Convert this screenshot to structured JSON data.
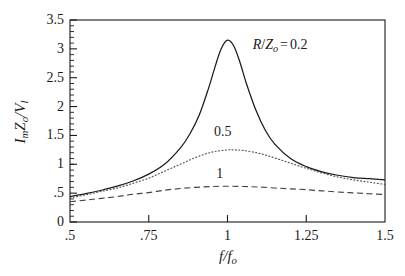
{
  "chart_data": {
    "type": "line",
    "title": "",
    "subtitle": "",
    "xlabel": "f/f_o",
    "ylabel": "I_m Z_o / V_l",
    "xlim": [
      0.5,
      1.5
    ],
    "ylim": [
      0,
      3.5
    ],
    "xticks": [
      0.5,
      0.75,
      1,
      1.25,
      1.5
    ],
    "xtick_labels": [
      ".5",
      ".75",
      "1",
      "1.25",
      "1.5"
    ],
    "yticks": [
      0,
      0.5,
      1,
      1.5,
      2,
      2.5,
      3,
      3.5
    ],
    "ytick_labels": [
      "0",
      ".5",
      "1",
      "1.5",
      "2",
      "2.5",
      "3",
      "3.5"
    ],
    "grid": false,
    "legend_position": "inline-annotations",
    "minor_ticks": true,
    "axis_color": "#1a1a1a",
    "background_color": "#ffffff",
    "series": [
      {
        "name": "R/Zo = 0.2",
        "label": "0.2",
        "style": "solid",
        "color": "#1a1a1a",
        "damping": 0.2,
        "peak_x": 1.0,
        "peak_y": 3.15,
        "x": [
          0.5,
          0.55,
          0.6,
          0.65,
          0.7,
          0.75,
          0.8,
          0.85,
          0.88,
          0.91,
          0.94,
          0.96,
          0.98,
          1.0,
          1.02,
          1.04,
          1.06,
          1.09,
          1.12,
          1.15,
          1.2,
          1.25,
          1.3,
          1.35,
          1.4,
          1.45,
          1.5
        ],
        "y": [
          0.44,
          0.49,
          0.55,
          0.62,
          0.71,
          0.83,
          1.0,
          1.28,
          1.52,
          1.85,
          2.32,
          2.68,
          3.0,
          3.15,
          3.05,
          2.76,
          2.4,
          1.94,
          1.59,
          1.35,
          1.1,
          0.96,
          0.87,
          0.81,
          0.77,
          0.75,
          0.73
        ]
      },
      {
        "name": "R/Zo = 0.5",
        "label": "0.5",
        "style": "dotted",
        "color": "#555555",
        "damping": 0.5,
        "peak_x": 1.02,
        "peak_y": 1.25,
        "x": [
          0.5,
          0.55,
          0.6,
          0.65,
          0.7,
          0.75,
          0.8,
          0.85,
          0.9,
          0.95,
          1.0,
          1.02,
          1.05,
          1.1,
          1.15,
          1.2,
          1.25,
          1.3,
          1.35,
          1.4,
          1.45,
          1.5
        ],
        "y": [
          0.42,
          0.47,
          0.53,
          0.59,
          0.67,
          0.76,
          0.88,
          1.0,
          1.12,
          1.21,
          1.25,
          1.25,
          1.24,
          1.19,
          1.11,
          1.02,
          0.93,
          0.85,
          0.78,
          0.73,
          0.69,
          0.65
        ]
      },
      {
        "name": "R/Zo = 1",
        "label": "1",
        "style": "dashed",
        "color": "#444444",
        "damping": 1.0,
        "peak_x": 0.99,
        "peak_y": 0.62,
        "x": [
          0.5,
          0.55,
          0.6,
          0.65,
          0.7,
          0.75,
          0.8,
          0.85,
          0.9,
          0.95,
          1.0,
          1.05,
          1.1,
          1.15,
          1.2,
          1.25,
          1.3,
          1.35,
          1.4,
          1.45,
          1.5
        ],
        "y": [
          0.35,
          0.38,
          0.41,
          0.44,
          0.48,
          0.51,
          0.55,
          0.58,
          0.6,
          0.615,
          0.62,
          0.615,
          0.605,
          0.59,
          0.575,
          0.56,
          0.54,
          0.52,
          0.505,
          0.49,
          0.475
        ]
      }
    ],
    "annotations": [
      {
        "id": "ann-02",
        "text": "R/Zo = 0.2",
        "x": 1.08,
        "y": 3.05
      },
      {
        "id": "ann-05",
        "text": "0.5",
        "x": 0.985,
        "y": 1.55
      },
      {
        "id": "ann-1",
        "text": "1",
        "x": 0.975,
        "y": 0.82
      }
    ]
  },
  "axes": {
    "x_title_numerator": "f",
    "x_title_denominator": "f",
    "x_title_denominator_sub": "o",
    "y_title_i": "I",
    "y_title_i_sub": "m",
    "y_title_z": "Z",
    "y_title_z_sub": "o",
    "y_title_v": "V",
    "y_title_v_sub": "l"
  },
  "annotations": {
    "curve_02_r": "R",
    "curve_02_slash": "/",
    "curve_02_z": "Z",
    "curve_02_z_sub": "o",
    "curve_02_eq": "=",
    "curve_02_value": "0.2",
    "curve_05_label": "0.5",
    "curve_1_label": "1"
  }
}
